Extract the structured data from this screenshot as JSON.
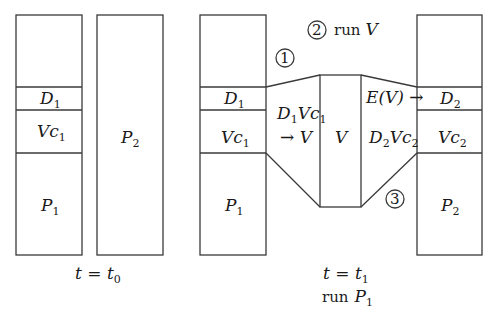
{
  "left_diagram": {
    "caption": "t = t",
    "caption_sub": "0",
    "process1": {
      "regions": [
        {
          "name": "D",
          "sub": "1"
        },
        {
          "name": "Vc",
          "sub": "1"
        },
        {
          "name": "P",
          "sub": "1"
        }
      ]
    },
    "process2": {
      "label": "P",
      "sub": "2"
    }
  },
  "right_diagram": {
    "caption": "t = t",
    "caption_sub": "1",
    "run_label": "run",
    "run_target": "P",
    "run_target_sub": "1",
    "process1": {
      "regions": [
        {
          "name": "D",
          "sub": "1"
        },
        {
          "name": "Vc",
          "sub": "1"
        },
        {
          "name": "P",
          "sub": "1"
        }
      ]
    },
    "process2": {
      "regions": [
        {
          "name": "D",
          "sub": "2"
        },
        {
          "name": "Vc",
          "sub": "2"
        },
        {
          "name": "P",
          "sub": "2"
        }
      ]
    },
    "virus": {
      "label": "V"
    },
    "left_transfer": {
      "line1a": "D",
      "line1a_sub": "1",
      "line1b": "Vc",
      "line1b_sub": "1",
      "line2": "→ V"
    },
    "right_transfer": {
      "top": "E(V) →",
      "mid_a": "D",
      "mid_a_sub": "2",
      "mid_b": "Vc",
      "mid_b_sub": "2"
    },
    "steps": [
      {
        "num": "1"
      },
      {
        "num": "2",
        "text": "run",
        "target": "V"
      },
      {
        "num": "3"
      }
    ]
  }
}
